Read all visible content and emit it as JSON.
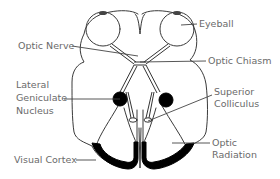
{
  "diagram": {
    "labels": {
      "eyeball": "Eyeball",
      "optic_nerve": "Optic Nerve",
      "optic_chiasm": "Optic Chiasm",
      "lgn_line1": "Lateral",
      "lgn_line2": "Geniculate",
      "lgn_line3": "Nucleus",
      "sc_line1": "Superior",
      "sc_line2": "Colliculus",
      "or_line1": "Optic",
      "or_line2": "Radiation",
      "visual_cortex": "Visual Cortex"
    },
    "colors": {
      "line": "#333333",
      "label": "#6a6a6a",
      "fill": "#000000",
      "background": "#ffffff"
    }
  }
}
